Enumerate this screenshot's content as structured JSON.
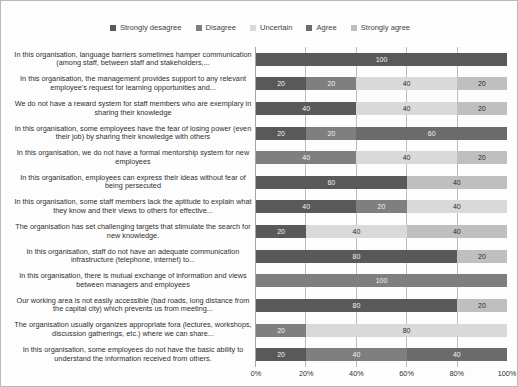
{
  "chart_data": {
    "type": "bar",
    "subtype": "horizontal-stacked-100-percent",
    "title": "",
    "xlabel": "",
    "ylabel": "",
    "xlim": [
      0,
      100
    ],
    "grid": true,
    "legend_position": "top",
    "xticks": [
      "0%",
      "20%",
      "40%",
      "60%",
      "80%",
      "100%"
    ],
    "series": [
      {
        "name": "Strongly desagree",
        "color": "#595959",
        "values": [
          100,
          20,
          40,
          20,
          0,
          60,
          40,
          20,
          80,
          0,
          80,
          0,
          20
        ]
      },
      {
        "name": "Disagree",
        "color": "#7f7f7f",
        "values": [
          0,
          20,
          0,
          20,
          40,
          0,
          20,
          0,
          0,
          100,
          0,
          20,
          40
        ]
      },
      {
        "name": "Uncertain",
        "color": "#d9d9d9",
        "values": [
          0,
          40,
          40,
          0,
          40,
          0,
          40,
          40,
          0,
          0,
          0,
          80,
          0
        ]
      },
      {
        "name": "Agree",
        "color": "#6b6b6b",
        "values": [
          0,
          0,
          0,
          60,
          0,
          0,
          0,
          0,
          0,
          0,
          0,
          0,
          40
        ]
      },
      {
        "name": "Strongly agree",
        "color": "#bfbfbf",
        "values": [
          0,
          20,
          20,
          0,
          20,
          40,
          0,
          40,
          20,
          0,
          20,
          0,
          0
        ]
      }
    ],
    "categories": [
      "In this organisation, language barriers sometimes hamper communication (among staff, between staff and stakeholders,...",
      "In this organisation, the management provides support to any relevant employee's request for learning opportunities and...",
      "We do not have a reward system for staff members who are exemplary in sharing their knowledge",
      "In this organisation, some employees have the fear of losing power (even their job) by sharing their knowledge with others",
      "In this organisation, we do not have a formal mentorship system for new employees",
      "In this organisation, employees can express their ideas without fear of being persecuted",
      "In this organisation, some staff members lack the aptitude to explain what they know and their views to others for effective...",
      "The organisation has set challenging targets that stimulate the search for new knowledge.",
      "In this organisation, staff do not have an adequate communication infrastructure (telephone, internet) to...",
      "In this organisation, there is mutual exchange of information and views between managers and employees",
      "Our working area is not easily accessible (bad roads, long distance from the capital city) which prevents us from meeting...",
      "The organisation usually organizes appropriate fora (lectures, workshops, discussion gatherings, etc.) where we can share...",
      "In this organisation, some employees do not have the basic ability to understand the information received from others."
    ],
    "rows": [
      {
        "segments": [
          {
            "series": "Strongly desagree",
            "value": 100,
            "label": "100"
          }
        ]
      },
      {
        "segments": [
          {
            "series": "Strongly desagree",
            "value": 20,
            "label": "20"
          },
          {
            "series": "Disagree",
            "value": 20,
            "label": "20"
          },
          {
            "series": "Uncertain",
            "value": 40,
            "label": "40"
          },
          {
            "series": "Strongly agree",
            "value": 20,
            "label": "20"
          }
        ]
      },
      {
        "segments": [
          {
            "series": "Strongly desagree",
            "value": 40,
            "label": "40"
          },
          {
            "series": "Disagree",
            "value": 0,
            "label": "0"
          },
          {
            "series": "Uncertain",
            "value": 40,
            "label": "40"
          },
          {
            "series": "Strongly agree",
            "value": 20,
            "label": "20"
          }
        ]
      },
      {
        "segments": [
          {
            "series": "Strongly desagree",
            "value": 20,
            "label": "20"
          },
          {
            "series": "Disagree",
            "value": 20,
            "label": "20"
          },
          {
            "series": "Uncertain",
            "value": 0,
            "label": "0"
          },
          {
            "series": "Agree",
            "value": 60,
            "label": "60"
          }
        ]
      },
      {
        "segments": [
          {
            "series": "Strongly desagree",
            "value": 0,
            "label": "0"
          },
          {
            "series": "Disagree",
            "value": 40,
            "label": "40"
          },
          {
            "series": "Uncertain",
            "value": 40,
            "label": "40"
          },
          {
            "series": "Strongly agree",
            "value": 20,
            "label": "20"
          }
        ]
      },
      {
        "segments": [
          {
            "series": "Strongly desagree",
            "value": 60,
            "label": "60"
          },
          {
            "series": "Strongly agree",
            "value": 40,
            "label": "40"
          }
        ]
      },
      {
        "segments": [
          {
            "series": "Strongly desagree",
            "value": 40,
            "label": "40"
          },
          {
            "series": "Disagree",
            "value": 20,
            "label": "20"
          },
          {
            "series": "Uncertain",
            "value": 40,
            "label": "40"
          }
        ]
      },
      {
        "segments": [
          {
            "series": "Strongly desagree",
            "value": 20,
            "label": "20"
          },
          {
            "series": "Disagree",
            "value": 0,
            "label": "0"
          },
          {
            "series": "Uncertain",
            "value": 40,
            "label": "40"
          },
          {
            "series": "Strongly agree",
            "value": 40,
            "label": "40"
          }
        ]
      },
      {
        "segments": [
          {
            "series": "Strongly desagree",
            "value": 80,
            "label": "80"
          },
          {
            "series": "Disagree",
            "value": 0,
            "label": "0"
          },
          {
            "series": "Strongly agree",
            "value": 20,
            "label": "20"
          }
        ]
      },
      {
        "segments": [
          {
            "series": "Strongly desagree",
            "value": 0,
            "label": "0"
          },
          {
            "series": "Disagree",
            "value": 100,
            "label": "100"
          },
          {
            "series": "Uncertain",
            "value": 0,
            "label": "0"
          }
        ]
      },
      {
        "segments": [
          {
            "series": "Strongly desagree",
            "value": 80,
            "label": "80"
          },
          {
            "series": "Disagree",
            "value": 0,
            "label": "0"
          },
          {
            "series": "Strongly agree",
            "value": 20,
            "label": "20"
          }
        ]
      },
      {
        "segments": [
          {
            "series": "Strongly desagree",
            "value": 0,
            "label": "0"
          },
          {
            "series": "Disagree",
            "value": 20,
            "label": "20"
          },
          {
            "series": "Uncertain",
            "value": 80,
            "label": "80"
          }
        ]
      },
      {
        "segments": [
          {
            "series": "Strongly desagree",
            "value": 20,
            "label": "20"
          },
          {
            "series": "Disagree",
            "value": 40,
            "label": "40"
          },
          {
            "series": "Uncertain",
            "value": 0,
            "label": "0"
          },
          {
            "series": "Agree",
            "value": 40,
            "label": "40"
          },
          {
            "series": "Strongly agree",
            "value": 0,
            "label": "0"
          }
        ]
      }
    ]
  }
}
